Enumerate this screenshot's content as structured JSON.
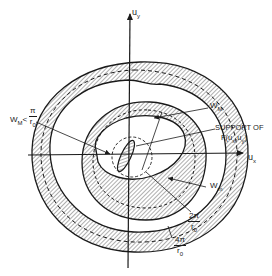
{
  "diagram": {
    "axes": {
      "vertical_label": "u",
      "vertical_label_sub": "y",
      "horizontal_label": "u",
      "horizontal_label_sub": "x"
    },
    "labels": {
      "wM_top": {
        "main": "W",
        "sub": "M"
      },
      "support": {
        "line1": "SUPPORT OF",
        "line2": "F(u",
        "sub1": "x",
        "mid": ",u",
        "sub2": "y",
        "end": ")"
      },
      "wm": {
        "main": "W",
        "sub": "m"
      },
      "wM_left": {
        "main": "W",
        "sub": "M",
        "lt": "<",
        "num": "π",
        "den": "r",
        "den_sub": "0"
      },
      "two_pi": {
        "num": "2π",
        "den": "r",
        "den_sub": "0"
      },
      "four_pi": {
        "num": "4π",
        "den": "r",
        "den_sub": "0"
      }
    },
    "colors": {
      "ink": "#1a1a1a",
      "background": "#ffffff"
    }
  }
}
